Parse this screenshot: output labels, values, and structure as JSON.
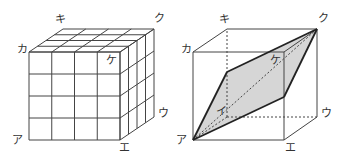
{
  "figures": [
    {
      "id": "left",
      "description": "4x4x4 cube made of unit cubes",
      "grid": 4,
      "vertices": {
        "A_front_bottom_left": [
          29,
          140
        ],
        "E_front_bottom_right": [
          120,
          140
        ],
        "F_front_top_left": [
          29,
          52
        ],
        "G_front_top_right": [
          120,
          52
        ],
        "K_back_top_left": [
          63,
          29
        ],
        "Q_back_top_right": [
          154,
          29
        ],
        "U_back_bottom_right": [
          154,
          117
        ]
      },
      "labels": [
        {
          "key": "a",
          "text": "ア",
          "x": 12,
          "y": 135
        },
        {
          "key": "e",
          "text": "エ",
          "x": 119,
          "y": 142
        },
        {
          "key": "u",
          "text": "ウ",
          "x": 158,
          "y": 108
        },
        {
          "key": "ka",
          "text": "カ",
          "x": 17,
          "y": 44
        },
        {
          "key": "ki",
          "text": "キ",
          "x": 55,
          "y": 14
        },
        {
          "key": "ku",
          "text": "ク",
          "x": 154,
          "y": 13
        },
        {
          "key": "ke",
          "text": "ケ",
          "x": 106,
          "y": 55
        }
      ]
    },
    {
      "id": "right",
      "description": "Cube with shaded parallelogram cross-section through ア and ク",
      "vertices": {
        "A": [
          193,
          140
        ],
        "E": [
          284,
          140
        ],
        "U": [
          317,
          117
        ],
        "I": [
          227,
          117
        ],
        "KA": [
          193,
          52
        ],
        "G": [
          284,
          52
        ],
        "KI": [
          227,
          29
        ],
        "KU": [
          317,
          29
        ]
      },
      "section": {
        "points": [
          [
            193,
            140
          ],
          [
            227,
            72
          ],
          [
            317,
            29
          ],
          [
            284,
            97
          ]
        ],
        "fill": "#d6d6d6",
        "stroke": "#222222"
      },
      "labels": [
        {
          "key": "a",
          "text": "ア",
          "x": 176,
          "y": 135
        },
        {
          "key": "i",
          "text": "イ",
          "x": 216,
          "y": 106
        },
        {
          "key": "e",
          "text": "エ",
          "x": 285,
          "y": 142
        },
        {
          "key": "u",
          "text": "ウ",
          "x": 321,
          "y": 108
        },
        {
          "key": "ka",
          "text": "カ",
          "x": 181,
          "y": 44
        },
        {
          "key": "ki",
          "text": "キ",
          "x": 219,
          "y": 14
        },
        {
          "key": "ku",
          "text": "ク",
          "x": 318,
          "y": 13
        },
        {
          "key": "ke",
          "text": "ケ",
          "x": 270,
          "y": 55
        }
      ]
    }
  ],
  "colors": {
    "line": "#444444",
    "bold_line": "#222222",
    "shade": "#d6d6d6",
    "label": "#333333"
  }
}
